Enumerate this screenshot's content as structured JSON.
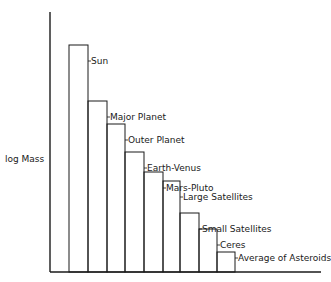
{
  "chart_data": {
    "type": "bar",
    "title": "",
    "xlabel": "",
    "ylabel": "log Mass",
    "grid": false,
    "legend": null,
    "categories": [
      "Sun",
      "Major Planet",
      "Outer Planet",
      "Earth-Venus",
      "Mars-Pluto",
      "Large Satellites",
      "Small Satellites",
      "Ceres",
      "Average of Asteroids"
    ],
    "values_note": "relative heights (px above baseline); no numeric axis ticks shown",
    "values": [
      227,
      171,
      148,
      120,
      100,
      91,
      59,
      43,
      20
    ]
  },
  "axis": {
    "y_label": "log Mass"
  }
}
